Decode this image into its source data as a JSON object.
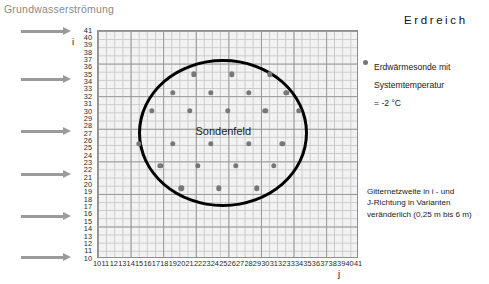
{
  "figure": {
    "flow_caption": "Grundwasserströmung",
    "soil_heading": "Erdreich",
    "field_label": "Sondenfeld"
  },
  "legend": {
    "marker": "borehole-dot",
    "text": "Erdwärmesonde mit\nSystemtemperatur\n= -2 °C"
  },
  "grid_note": {
    "text": "Gitternetzweite in i - und\nJ-Richtung in Varianten\nveränderlich (0,25 m bis 6 m)"
  },
  "axes": {
    "y_name": "i",
    "x_name": "j",
    "y_ticks": [
      41,
      40,
      39,
      38,
      37,
      36,
      35,
      34,
      33,
      32,
      31,
      30,
      29,
      28,
      27,
      26,
      25,
      24,
      23,
      22,
      21,
      20,
      19,
      18,
      17,
      16,
      15,
      14,
      13,
      12,
      11,
      10
    ],
    "x_ticks": [
      10,
      11,
      12,
      13,
      14,
      15,
      16,
      17,
      18,
      19,
      20,
      21,
      22,
      23,
      24,
      25,
      26,
      27,
      28,
      29,
      30,
      31,
      32,
      33,
      34,
      35,
      36,
      37,
      38,
      39,
      40,
      41
    ]
  },
  "arrows": {
    "count": 6,
    "name": "groundwater-flow-arrow",
    "tops": [
      28,
      76,
      128,
      171,
      213,
      254
    ]
  },
  "chart_data": {
    "type": "scatter",
    "title": "Sondenfeld",
    "xlabel": "j",
    "ylabel": "i",
    "xlim": [
      10,
      41
    ],
    "ylim": [
      10,
      41
    ],
    "grid": true,
    "legend_position": "right",
    "series": [
      {
        "name": "Erdwärmesonde mit Systemtemperatur = -2 °C",
        "color": "#777777",
        "points": [
          {
            "x": 21.5,
            "y": 35.0
          },
          {
            "x": 26.0,
            "y": 35.0
          },
          {
            "x": 30.5,
            "y": 35.0
          },
          {
            "x": 19.0,
            "y": 32.5
          },
          {
            "x": 23.5,
            "y": 32.5
          },
          {
            "x": 28.0,
            "y": 32.5
          },
          {
            "x": 32.5,
            "y": 32.5
          },
          {
            "x": 16.5,
            "y": 30.0
          },
          {
            "x": 21.0,
            "y": 30.0
          },
          {
            "x": 25.5,
            "y": 30.0
          },
          {
            "x": 30.0,
            "y": 30.0
          },
          {
            "x": 34.0,
            "y": 30.0
          },
          {
            "x": 15.0,
            "y": 25.5
          },
          {
            "x": 19.0,
            "y": 25.5
          },
          {
            "x": 23.5,
            "y": 25.5
          },
          {
            "x": 28.0,
            "y": 25.5
          },
          {
            "x": 32.0,
            "y": 25.5
          },
          {
            "x": 17.5,
            "y": 22.5
          },
          {
            "x": 22.0,
            "y": 22.5
          },
          {
            "x": 26.5,
            "y": 22.5
          },
          {
            "x": 31.0,
            "y": 22.5
          },
          {
            "x": 20.0,
            "y": 19.5
          },
          {
            "x": 24.5,
            "y": 19.5
          },
          {
            "x": 29.0,
            "y": 19.5
          }
        ]
      }
    ],
    "annotations": [
      {
        "text": "Sondenfeld",
        "x": 25.0,
        "y": 27.3
      },
      {
        "shape": "circle",
        "name": "borehole-field-boundary",
        "cx": 25.0,
        "cy": 27.0,
        "r": 10.1
      }
    ]
  }
}
